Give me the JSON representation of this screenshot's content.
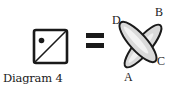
{
  "diagram": {
    "caption": "Diagram 4",
    "left_symbol": {
      "shape": "square",
      "contents": [
        "diagonal-line-bottom-left-to-top-right",
        "dot-upper-left"
      ]
    },
    "operator": "=",
    "right_symbol": {
      "shape": "two-crossed-ovals",
      "labels": {
        "A": "A",
        "B": "B",
        "C": "C",
        "D": "D"
      }
    },
    "colors": {
      "ink": "#1a1a1a",
      "oval_fill": "#d9d9d9",
      "oval_highlight": "#f2f2f2",
      "background": "#ffffff"
    }
  }
}
